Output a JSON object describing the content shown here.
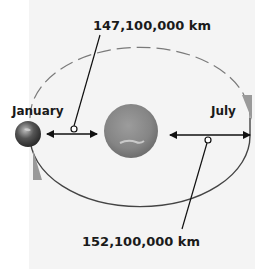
{
  "diagram": {
    "labels": {
      "perihelion_distance": "147,100,000 km",
      "aphelion_distance": "152,100,000 km",
      "january": "January",
      "july": "July"
    },
    "colors": {
      "background_panel": "#f4f4f4",
      "orbit": "#555555",
      "sun": "#8a8a8a",
      "earth": "#5a5a5a",
      "arrow": "#111111"
    }
  }
}
